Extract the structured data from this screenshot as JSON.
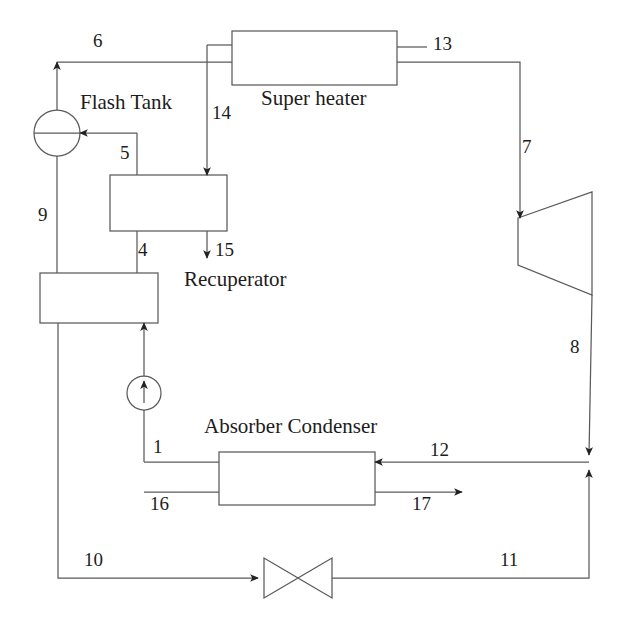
{
  "diagram": {
    "type": "process-flow-diagram",
    "stroke_color": "#4a4a4a",
    "text_color": "#1c1c1c",
    "background": "#ffffff",
    "equipment": [
      {
        "id": "flash-tank",
        "label": "Flash Tank",
        "shape": "circle",
        "cx": 57,
        "cy": 133,
        "r": 23
      },
      {
        "id": "super-heater",
        "label": "Super heater",
        "shape": "rectangle",
        "x": 232,
        "y": 31,
        "w": 165,
        "h": 54
      },
      {
        "id": "recuperator",
        "label": "Recuperator",
        "shape": "rectangle",
        "x": 110,
        "y": 175,
        "w": 117,
        "h": 56
      },
      {
        "id": "generator",
        "label": "",
        "shape": "rectangle",
        "x": 40,
        "y": 273,
        "w": 118,
        "h": 50
      },
      {
        "id": "absorber-condenser",
        "label": "Absorber Condenser",
        "shape": "rectangle",
        "x": 219,
        "y": 452,
        "w": 156,
        "h": 53
      },
      {
        "id": "turbine",
        "label": "",
        "shape": "trapezoid",
        "x": 518,
        "y": 192,
        "w": 74,
        "h": 103
      },
      {
        "id": "pump",
        "label": "",
        "shape": "circle",
        "cx": 144,
        "cy": 393,
        "r": 17
      },
      {
        "id": "throttle-valve",
        "label": "",
        "shape": "bowtie",
        "cx": 298,
        "cy": 578,
        "w": 68,
        "h": 40
      }
    ],
    "equipment_labels": [
      {
        "id": "flash-tank-label",
        "text": "Flash Tank",
        "x": 80,
        "y": 92,
        "size": "cap"
      },
      {
        "id": "super-heater-label",
        "text": "Super heater",
        "x": 261,
        "y": 88,
        "size": "cap"
      },
      {
        "id": "recuperator-label",
        "text": "Recuperator",
        "x": 184,
        "y": 269,
        "size": "cap"
      },
      {
        "id": "absorber-condenser-label",
        "text": "Absorber Condenser",
        "x": 204,
        "y": 416,
        "size": "cap"
      }
    ],
    "stream_labels": [
      {
        "id": "stream-6",
        "text": "6",
        "x": 93,
        "y": 31
      },
      {
        "id": "stream-13",
        "text": "13",
        "x": 433,
        "y": 34
      },
      {
        "id": "stream-14",
        "text": "14",
        "x": 212,
        "y": 103
      },
      {
        "id": "stream-5",
        "text": "5",
        "x": 120,
        "y": 143
      },
      {
        "id": "stream-7",
        "text": "7",
        "x": 522,
        "y": 137
      },
      {
        "id": "stream-9",
        "text": "9",
        "x": 38,
        "y": 205
      },
      {
        "id": "stream-4",
        "text": "4",
        "x": 138,
        "y": 240
      },
      {
        "id": "stream-15",
        "text": "15",
        "x": 215,
        "y": 240
      },
      {
        "id": "stream-8",
        "text": "8",
        "x": 570,
        "y": 337
      },
      {
        "id": "stream-1",
        "text": "1",
        "x": 153,
        "y": 437
      },
      {
        "id": "stream-12",
        "text": "12",
        "x": 430,
        "y": 440
      },
      {
        "id": "stream-16",
        "text": "16",
        "x": 150,
        "y": 494
      },
      {
        "id": "stream-17",
        "text": "17",
        "x": 412,
        "y": 494
      },
      {
        "id": "stream-10",
        "text": "10",
        "x": 84,
        "y": 550
      },
      {
        "id": "stream-11",
        "text": "11",
        "x": 500,
        "y": 550
      }
    ]
  }
}
